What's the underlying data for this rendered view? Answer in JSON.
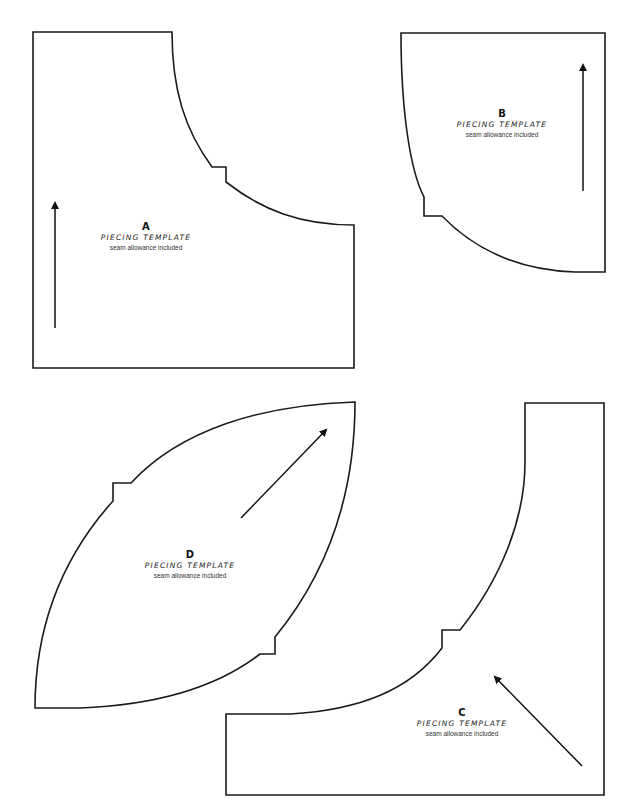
{
  "page": {
    "background": "#ffffff",
    "stroke_color": "#1a1a1a"
  },
  "templates": [
    {
      "id": "A",
      "letter": "A",
      "title": "PIECING TEMPLATE",
      "subtitle": "seam allowance included",
      "grain_arrow": "up"
    },
    {
      "id": "B",
      "letter": "B",
      "title": "PIECING TEMPLATE",
      "subtitle": "seam allowance included",
      "grain_arrow": "up"
    },
    {
      "id": "C",
      "letter": "C",
      "title": "PIECING TEMPLATE",
      "subtitle": "seam allowance included",
      "grain_arrow": "up-left diagonal"
    },
    {
      "id": "D",
      "letter": "D",
      "title": "PIECING TEMPLATE",
      "subtitle": "seam allowance included",
      "grain_arrow": "up-right diagonal"
    }
  ]
}
